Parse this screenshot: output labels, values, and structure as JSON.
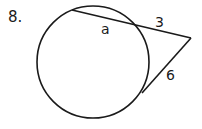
{
  "problem": {
    "number": "8.",
    "labels": {
      "secant_internal": "a",
      "secant_external": "3",
      "tangent": "6"
    }
  },
  "colors": {
    "stroke": "#1a1a1a",
    "background": "#ffffff"
  }
}
